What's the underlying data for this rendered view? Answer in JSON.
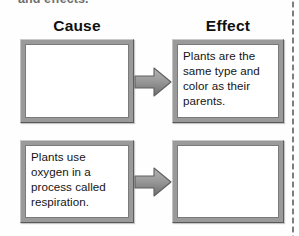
{
  "worksheet": {
    "instruction_partial": "and effects.",
    "columns": {
      "cause_heading": "Cause",
      "effect_heading": "Effect"
    },
    "rows": [
      {
        "row_label": "row-1",
        "cause_text": "",
        "arrow_icon": "right-block-arrow-icon",
        "effect_text": "Plants are the same type and color as their parents."
      },
      {
        "row_label": "row-2",
        "cause_text": "Plants use oxygen in a process called respiration.",
        "arrow_icon": "right-block-arrow-icon",
        "effect_text": ""
      }
    ],
    "cut_line": "dotted-cut-line"
  },
  "colors": {
    "page_background": "#fefefe",
    "frame_gray": "#9a9a9a",
    "frame_shadow": "#585858",
    "arrow_gray": "#8f8f8f",
    "text": "#141414",
    "instruction_gray": "#6f6f6f",
    "cut_line_gray": "#7e7e7e"
  }
}
